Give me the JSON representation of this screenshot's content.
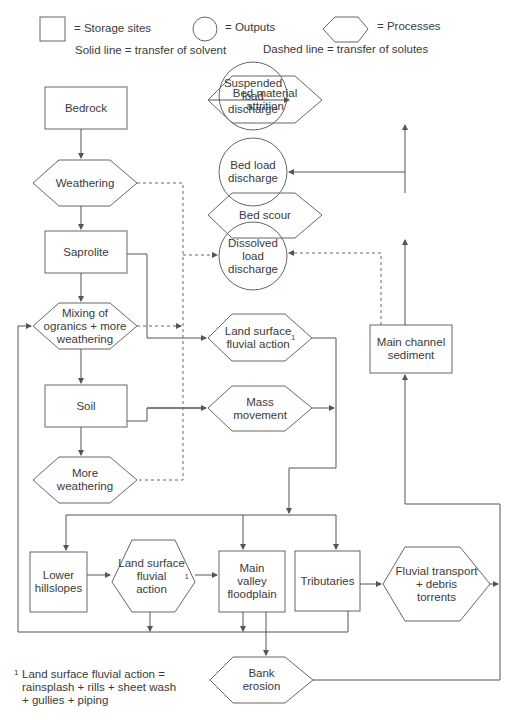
{
  "legend": {
    "storage": "= Storage sites",
    "outputs": "= Outputs",
    "processes": "= Processes",
    "solid": "Solid line = transfer of solvent",
    "dashed": "Dashed line = transfer of solutes"
  },
  "nodes": {
    "bedrock": "Bedrock",
    "weathering": "Weathering",
    "saprolite": "Saprolite",
    "mixing": "Mixing of\nogranics + more\nweathering",
    "soil": "Soil",
    "more_weathering": "More\nweathering",
    "suspended": "Suspended\nload\ndischarge",
    "bed_load": "Bed load\ndischarge",
    "dissolved": "Dissolved\nload\ndischarge",
    "bed_attrition": "Bed material\nattrition",
    "bed_scour": "Bed scour",
    "main_channel": "Main channel\nsediment",
    "land_surface_top": "Land surface\nfluvial action",
    "mass_movement": "Mass\nmovement",
    "lower_hillslopes": "Lower\nhillslopes",
    "land_surface_bottom": "Land surface\nfluvial\naction",
    "main_valley": "Main\nvalley\nfloodplain",
    "tributaries": "Tributaries",
    "fluvial_transport": "Fluvial transport\n+ debris\ntorrents",
    "bank_erosion": "Bank\nerosion"
  },
  "superscript": "1",
  "footnote": {
    "mark": "1",
    "text": "Land surface fluvial action =\nrainsplash + rills + sheet wash\n+ gullies + piping"
  },
  "colors": {
    "line": "#555555",
    "text": "#3a3a3a",
    "background": "#ffffff"
  }
}
